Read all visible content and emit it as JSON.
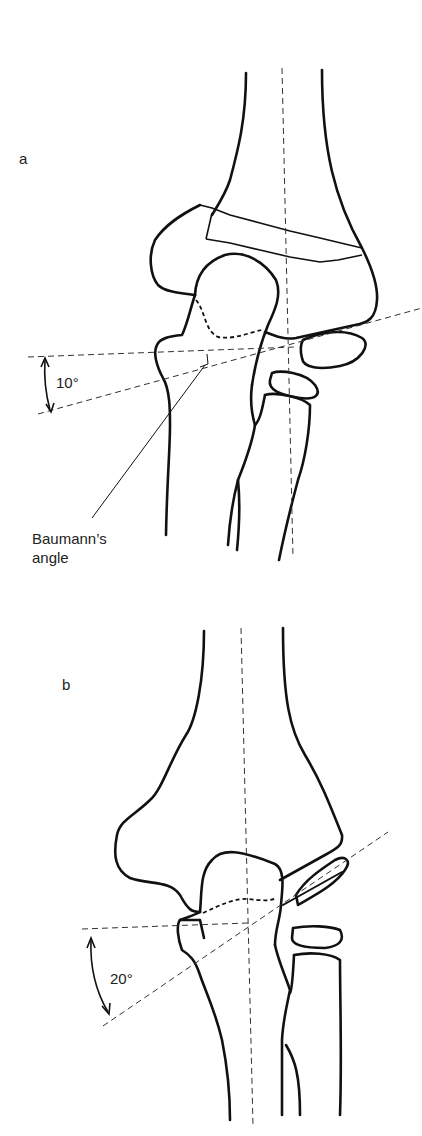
{
  "figure": {
    "panels": [
      {
        "id": "a",
        "label": "a",
        "angle_label": "10°",
        "annotation": [
          "Baumann’s",
          "angle"
        ]
      },
      {
        "id": "b",
        "label": "b",
        "angle_label": "20°"
      }
    ],
    "colors": {
      "line": "#111111",
      "dashed": "#333333",
      "background": "#ffffff"
    }
  }
}
